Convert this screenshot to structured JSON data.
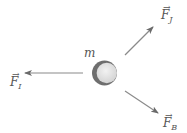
{
  "diagram": {
    "title": "",
    "mass_label": "m",
    "forces": [
      {
        "id": "F_J",
        "symbol": "F",
        "vector_mark": "→",
        "subscript": "J",
        "direction": "up-right"
      },
      {
        "id": "F_I",
        "symbol": "F",
        "vector_mark": "→",
        "subscript": "I",
        "direction": "left"
      },
      {
        "id": "F_B",
        "symbol": "F",
        "vector_mark": "→",
        "subscript": "B",
        "direction": "down-right"
      }
    ],
    "colors": {
      "arrow": "#7a7a7a",
      "ball_dark": "#6e6e6e",
      "ball_light": "#e4e4e4",
      "text": "#555555",
      "background": "#ffffff"
    }
  }
}
